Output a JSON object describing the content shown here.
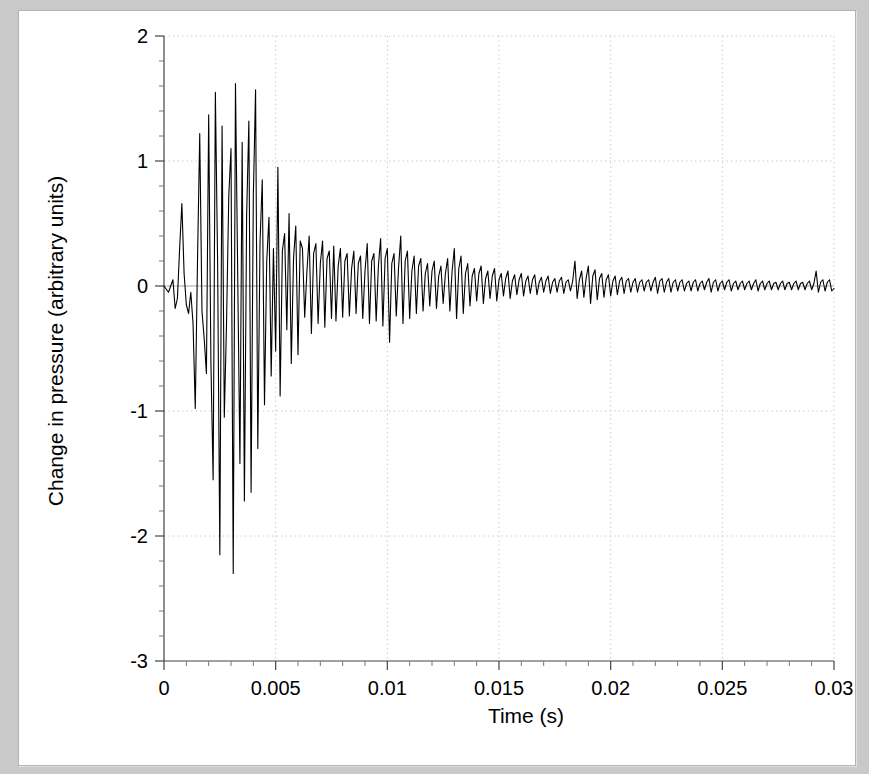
{
  "chart_data": {
    "type": "line",
    "title": "",
    "xlabel": "Time (s)",
    "ylabel": "Change in pressure (arbitrary units)",
    "xlim": [
      0,
      0.03
    ],
    "ylim": [
      -3,
      2
    ],
    "xticks": [
      0,
      0.005,
      0.01,
      0.015,
      0.02,
      0.025,
      0.03
    ],
    "xticklabels": [
      "0",
      "0.005",
      "0.01",
      "0.015",
      "0.02",
      "0.025",
      "0.03"
    ],
    "yticks": [
      2,
      1,
      0,
      -1,
      -2,
      -3
    ],
    "yticklabels": [
      "2",
      "1",
      "0",
      "-1",
      "-2",
      "-3"
    ],
    "minor_ticks_per_interval": 5,
    "grid": true,
    "grid_style": "dotted",
    "grid_color": "#cccccc",
    "legend": null,
    "line_color": "#000000",
    "line_width": 1.1,
    "series_name": "pressure waveform",
    "x": [
      0.0,
      0.0002,
      0.0004,
      0.0005,
      0.0006,
      0.0007,
      0.0008,
      0.0009,
      0.001,
      0.0011,
      0.0012,
      0.0013,
      0.0014,
      0.0015,
      0.0016,
      0.0017,
      0.0018,
      0.0019,
      0.002,
      0.0021,
      0.0022,
      0.0023,
      0.0024,
      0.0025,
      0.0026,
      0.0027,
      0.0028,
      0.0029,
      0.003,
      0.0031,
      0.0032,
      0.0033,
      0.0034,
      0.0035,
      0.0036,
      0.0037,
      0.0038,
      0.0039,
      0.004,
      0.0041,
      0.0042,
      0.0043,
      0.0044,
      0.0045,
      0.0046,
      0.0047,
      0.0048,
      0.0049,
      0.005,
      0.0051,
      0.0052,
      0.0053,
      0.0054,
      0.0055,
      0.0056,
      0.0057,
      0.0058,
      0.0059,
      0.006,
      0.0061,
      0.0062,
      0.0063,
      0.0064,
      0.0065,
      0.0066,
      0.0067,
      0.0068,
      0.0069,
      0.007,
      0.0071,
      0.0072,
      0.0073,
      0.0074,
      0.0075,
      0.0076,
      0.0077,
      0.0078,
      0.0079,
      0.008,
      0.0081,
      0.0082,
      0.0083,
      0.0084,
      0.0085,
      0.0086,
      0.0087,
      0.0088,
      0.0089,
      0.009,
      0.0091,
      0.0092,
      0.0093,
      0.0094,
      0.0095,
      0.0096,
      0.0097,
      0.0098,
      0.0099,
      0.01,
      0.0101,
      0.0102,
      0.0103,
      0.0104,
      0.0105,
      0.0106,
      0.0107,
      0.0108,
      0.0109,
      0.011,
      0.0111,
      0.0112,
      0.0113,
      0.0114,
      0.0115,
      0.0116,
      0.0117,
      0.0118,
      0.0119,
      0.012,
      0.0121,
      0.0122,
      0.0123,
      0.0124,
      0.0125,
      0.0126,
      0.0127,
      0.0128,
      0.0129,
      0.013,
      0.0131,
      0.0132,
      0.0133,
      0.0134,
      0.0135,
      0.0136,
      0.0137,
      0.0138,
      0.0139,
      0.014,
      0.0141,
      0.0142,
      0.0143,
      0.0144,
      0.0145,
      0.0146,
      0.0147,
      0.0148,
      0.0149,
      0.015,
      0.0151,
      0.0152,
      0.0153,
      0.0154,
      0.0155,
      0.0156,
      0.0157,
      0.0158,
      0.0159,
      0.016,
      0.0161,
      0.0162,
      0.0163,
      0.0164,
      0.0165,
      0.0166,
      0.0167,
      0.0168,
      0.0169,
      0.017,
      0.0171,
      0.0172,
      0.0173,
      0.0174,
      0.0175,
      0.0176,
      0.0177,
      0.0178,
      0.0179,
      0.018,
      0.0181,
      0.0182,
      0.0183,
      0.0184,
      0.0185,
      0.0186,
      0.0187,
      0.0188,
      0.0189,
      0.019,
      0.0191,
      0.0192,
      0.0193,
      0.0194,
      0.0195,
      0.0196,
      0.0197,
      0.0198,
      0.0199,
      0.02,
      0.0201,
      0.0202,
      0.0203,
      0.0204,
      0.0205,
      0.0206,
      0.0207,
      0.0208,
      0.0209,
      0.021,
      0.0211,
      0.0212,
      0.0213,
      0.0214,
      0.0215,
      0.0216,
      0.0217,
      0.0218,
      0.0219,
      0.022,
      0.0221,
      0.0222,
      0.0223,
      0.0224,
      0.0225,
      0.0226,
      0.0227,
      0.0228,
      0.0229,
      0.023,
      0.0231,
      0.0232,
      0.0233,
      0.0234,
      0.0235,
      0.0236,
      0.0237,
      0.0238,
      0.0239,
      0.024,
      0.0241,
      0.0242,
      0.0243,
      0.0244,
      0.0245,
      0.0246,
      0.0247,
      0.0248,
      0.0249,
      0.025,
      0.0251,
      0.0252,
      0.0253,
      0.0254,
      0.0255,
      0.0256,
      0.0257,
      0.0258,
      0.0259,
      0.026,
      0.0261,
      0.0262,
      0.0263,
      0.0264,
      0.0265,
      0.0266,
      0.0267,
      0.0268,
      0.0269,
      0.027,
      0.0271,
      0.0272,
      0.0273,
      0.0274,
      0.0275,
      0.0276,
      0.0277,
      0.0278,
      0.0279,
      0.028,
      0.0281,
      0.0282,
      0.0283,
      0.0284,
      0.0285,
      0.0286,
      0.0287,
      0.0288,
      0.0289,
      0.029,
      0.0291,
      0.0292,
      0.0293,
      0.0294,
      0.0295,
      0.0296,
      0.0297,
      0.0298,
      0.0299,
      0.03
    ],
    "y": [
      0.0,
      -0.05,
      0.05,
      -0.18,
      -0.1,
      0.3,
      0.66,
      0.1,
      -0.15,
      -0.22,
      -0.05,
      -0.3,
      -0.98,
      0.2,
      1.22,
      -0.2,
      -0.42,
      -0.7,
      1.37,
      -0.6,
      -1.55,
      1.55,
      0.2,
      -2.15,
      1.28,
      -1.05,
      -0.3,
      0.72,
      1.1,
      -2.3,
      1.62,
      0.1,
      -1.42,
      1.15,
      -1.72,
      0.56,
      1.32,
      -1.65,
      0.72,
      1.57,
      -1.3,
      0.35,
      0.85,
      -0.95,
      0.2,
      0.55,
      -0.72,
      0.3,
      -0.52,
      0.95,
      -0.88,
      0.28,
      0.42,
      -0.35,
      0.58,
      -0.62,
      0.22,
      0.48,
      -0.55,
      0.36,
      0.3,
      -0.25,
      0.12,
      0.4,
      -0.38,
      0.26,
      0.34,
      -0.3,
      0.18,
      0.36,
      -0.33,
      0.22,
      0.28,
      -0.26,
      0.32,
      -0.28,
      0.16,
      0.3,
      -0.25,
      0.2,
      0.26,
      -0.24,
      0.14,
      0.28,
      -0.22,
      0.18,
      0.24,
      -0.26,
      0.12,
      0.34,
      -0.3,
      0.2,
      0.26,
      -0.28,
      0.16,
      0.38,
      -0.32,
      0.22,
      0.3,
      -0.45,
      0.18,
      0.26,
      -0.24,
      0.14,
      0.4,
      -0.3,
      0.2,
      0.28,
      -0.26,
      0.12,
      0.24,
      -0.22,
      0.16,
      0.22,
      -0.2,
      0.1,
      0.18,
      -0.16,
      0.12,
      0.2,
      -0.18,
      0.08,
      0.16,
      -0.14,
      0.1,
      0.22,
      -0.2,
      0.12,
      0.3,
      -0.26,
      0.14,
      0.24,
      -0.22,
      0.1,
      0.18,
      -0.16,
      0.08,
      0.14,
      -0.12,
      0.1,
      0.16,
      -0.14,
      0.06,
      0.12,
      -0.1,
      0.08,
      0.14,
      -0.12,
      0.05,
      0.1,
      -0.08,
      0.06,
      0.12,
      -0.1,
      0.04,
      0.09,
      -0.07,
      0.05,
      0.1,
      -0.08,
      0.04,
      0.08,
      -0.06,
      0.05,
      0.09,
      -0.07,
      0.03,
      0.07,
      -0.05,
      0.04,
      0.08,
      -0.06,
      0.03,
      0.06,
      -0.05,
      0.04,
      0.07,
      -0.06,
      0.03,
      0.05,
      -0.04,
      0.04,
      0.2,
      -0.1,
      0.05,
      0.12,
      -0.09,
      0.06,
      0.16,
      -0.14,
      0.08,
      0.13,
      -0.11,
      0.06,
      0.1,
      -0.09,
      0.05,
      0.09,
      -0.08,
      0.04,
      0.08,
      -0.07,
      0.04,
      0.07,
      -0.06,
      0.04,
      0.06,
      -0.05,
      0.03,
      0.06,
      -0.05,
      0.03,
      0.05,
      -0.04,
      0.03,
      0.05,
      -0.04,
      0.03,
      0.07,
      -0.06,
      0.04,
      0.06,
      -0.05,
      0.03,
      0.06,
      -0.05,
      0.03,
      0.05,
      -0.04,
      0.03,
      0.05,
      -0.04,
      0.02,
      0.04,
      -0.04,
      0.03,
      0.05,
      -0.04,
      0.02,
      0.04,
      -0.03,
      0.03,
      0.06,
      -0.05,
      0.03,
      0.05,
      -0.04,
      0.02,
      0.04,
      -0.03,
      0.03,
      0.05,
      -0.04,
      0.02,
      0.04,
      -0.03,
      0.02,
      0.04,
      -0.03,
      0.02,
      0.04,
      -0.03,
      0.02,
      0.05,
      -0.04,
      0.02,
      0.04,
      -0.03,
      0.02,
      0.04,
      -0.03,
      0.02,
      0.03,
      -0.03,
      0.02,
      0.04,
      -0.03,
      0.02,
      0.03,
      -0.03,
      0.02,
      0.04,
      -0.03,
      0.02,
      0.03,
      -0.03,
      0.02,
      0.04,
      -0.03,
      0.02,
      0.12,
      -0.05,
      0.03,
      0.05,
      -0.04,
      0.03,
      0.05,
      -0.04,
      -0.02
    ]
  }
}
